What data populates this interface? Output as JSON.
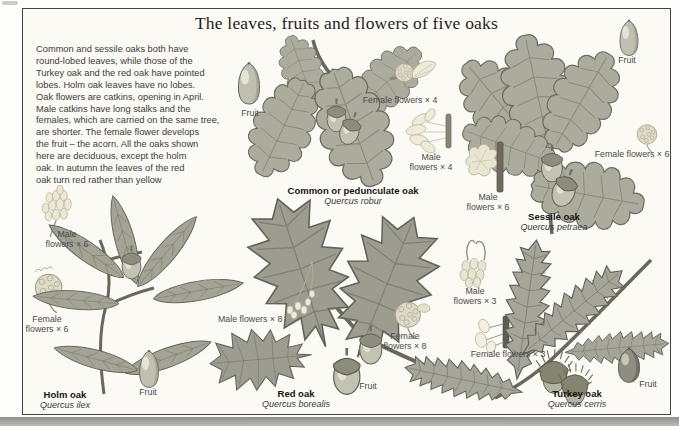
{
  "page": {
    "title": "The leaves, fruits and flowers of five oaks",
    "intro": "Common and sessile oaks both have\nround-lobed leaves, while those of the\nTurkey oak and the red oak have pointed\nlobes. Holm oak leaves have no lobes.\nOak flowers are catkins, opening in April.\nMale catkins have long stalks and the\nfemales, which are carried on the same tree,\nare shorter. The female flower develops\nthe fruit – the acorn. All the oaks shown\nhere are deciduous, except the holm\noak. In autumn the leaves of the red\noak turn red rather than yellow"
  },
  "species": {
    "common": {
      "name": "Common or pedunculate oak",
      "latin": "Quercus robur",
      "fruit_label": "Fruit",
      "female_label": "Female flowers × 4",
      "male_label": "Male\nflowers × 4"
    },
    "sessile": {
      "name": "Sessile oak",
      "latin": "Quercus petraea",
      "fruit_label": "Fruit",
      "female_label": "Female flowers × 6",
      "male_label": "Male\nflowers × 6"
    },
    "holm": {
      "name": "Holm oak",
      "latin": "Quercus ilex",
      "fruit_label": "Fruit",
      "female_label": "Female\nflowers × 6",
      "male_label": "Male\nflowers × 6"
    },
    "red": {
      "name": "Red oak",
      "latin": "Quercus borealis",
      "fruit_label": "Fruit",
      "female_label": "Female\nflowers × 8",
      "male_label": "Male flowers × 8"
    },
    "turkey": {
      "name": "Turkey oak",
      "latin": "Quercus cerris",
      "fruit_label": "Fruit",
      "female_label": "Female flowers × 3",
      "male_label": "Male\nflowers × 3"
    }
  },
  "colors": {
    "page_background": "#fbfaf5",
    "frame_border": "#45453f",
    "leaf_grey_green": "#abab9e",
    "red_oak_leaf": "#9c9c91",
    "flower_cream": "#ebe7d2",
    "acorn": "#c0c0b1",
    "text_dark": "#3c3c3c"
  }
}
